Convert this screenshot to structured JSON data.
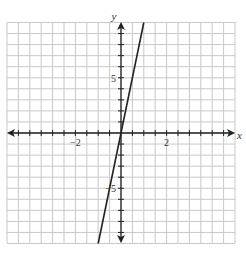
{
  "chart_data": {
    "type": "line",
    "title": "",
    "xlabel": "x",
    "ylabel": "y",
    "xlim": [
      -5,
      5
    ],
    "ylim": [
      -10,
      10
    ],
    "x_grid_step": 0.5,
    "y_grid_step": 1,
    "grid": true,
    "x_tick_labels": [
      {
        "value": -2,
        "label": "−2"
      },
      {
        "value": 2,
        "label": "2"
      }
    ],
    "y_tick_labels": [
      {
        "value": 5,
        "label": "5"
      },
      {
        "value": -5,
        "label": "−5"
      }
    ],
    "series": [
      {
        "name": "line",
        "equation": "y = 10x",
        "x": [
          -1,
          1
        ],
        "y": [
          -10,
          10
        ]
      }
    ],
    "legend": null
  },
  "colors": {
    "grid": "#c8c8c8",
    "axis": "#222222",
    "line": "#222222",
    "background": "#ffffff"
  }
}
